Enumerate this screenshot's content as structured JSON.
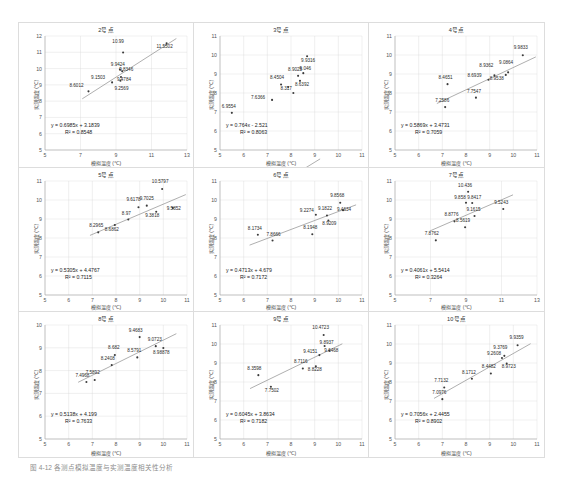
{
  "figure": {
    "caption": "图 4-12  各测点模拟温度与实测温度相关性分析",
    "axis_x_label": "模拟温度 (℃)",
    "axis_y_label": "实测温度 (℃)",
    "marker_color": "#3b3b3b",
    "trend_color": "#8c8c8c",
    "grid_color": "#d9d9d9"
  },
  "chart_data": [
    {
      "type": "scatter",
      "title": "2号点",
      "xlabel": "模拟温度 (℃)",
      "ylabel": "实测温度 (℃)",
      "xlim": [
        5,
        13
      ],
      "ylim": [
        5,
        12
      ],
      "xticks": [
        5,
        7,
        9,
        11,
        13
      ],
      "yticks": [
        5,
        6,
        7,
        8,
        9,
        10,
        11,
        12
      ],
      "grid": true,
      "equation": "y = 0.6985x + 3.1839",
      "r2": "R² = 0.8548",
      "slope": 0.6985,
      "intercept": 3.1839,
      "points": [
        {
          "x": 7.45,
          "y": 8.6012,
          "label": "8.6012",
          "lx": -12,
          "ly": -4
        },
        {
          "x": 8.78,
          "y": 9.1503,
          "label": "9.1503",
          "lx": -14,
          "ly": -3
        },
        {
          "x": 9.35,
          "y": 9.8346,
          "label": "9.8346",
          "lx": 4,
          "ly": 0
        },
        {
          "x": 9.28,
          "y": 9.4784,
          "label": "9.4784",
          "lx": 3,
          "ly": 4
        },
        {
          "x": 9.25,
          "y": 9.2569,
          "label": "9.2569",
          "lx": 1,
          "ly": 9
        },
        {
          "x": 9.22,
          "y": 9.9424,
          "label": "9.9424",
          "lx": -2,
          "ly": -4
        },
        {
          "x": 9.4,
          "y": 10.99,
          "label": "10.99",
          "lx": -5,
          "ly": -9
        },
        {
          "x": 11.85,
          "y": 11.5502,
          "label": "11.5502",
          "lx": -2,
          "ly": 5
        }
      ]
    },
    {
      "type": "scatter",
      "title": "3号点",
      "xlabel": "模拟温度 (℃)",
      "ylabel": "实测温度 (℃)",
      "xlim": [
        5,
        11
      ],
      "ylim": [
        5,
        11
      ],
      "xticks": [
        5,
        6,
        7,
        8,
        9,
        10,
        11
      ],
      "yticks": [
        5,
        6,
        7,
        8,
        9,
        10,
        11
      ],
      "grid": true,
      "equation": "y = 0.764x - 2.521",
      "r2": "R² = 0.8063",
      "slope": 0.764,
      "intercept": -2.521,
      "points": [
        {
          "x": 5.5,
          "y": 6.9554,
          "label": "6.9554",
          "lx": -3,
          "ly": -5
        },
        {
          "x": 7.2,
          "y": 7.6366,
          "label": "7.6366",
          "lx": -14,
          "ly": -1
        },
        {
          "x": 7.58,
          "y": 8.4504,
          "label": "8.4504",
          "lx": -4,
          "ly": -5
        },
        {
          "x": 7.88,
          "y": 8.317,
          "label": "8.317",
          "lx": -2,
          "ly": 3
        },
        {
          "x": 8.1,
          "y": 8.0,
          "label": "",
          "lx": 0,
          "ly": 0
        },
        {
          "x": 8.3,
          "y": 8.9025,
          "label": "8.9025",
          "lx": -3,
          "ly": -5
        },
        {
          "x": 8.38,
          "y": 8.6392,
          "label": "8.6392",
          "lx": 2,
          "ly": 5
        },
        {
          "x": 8.52,
          "y": 9.046,
          "label": "9.046",
          "lx": 2,
          "ly": -3
        },
        {
          "x": 8.68,
          "y": 9.9316,
          "label": "9.9316",
          "lx": 1,
          "ly": 6
        }
      ]
    },
    {
      "type": "scatter",
      "title": "4号点",
      "xlabel": "模拟温度 (℃)",
      "ylabel": "实测温度 (℃)",
      "xlim": [
        5,
        11
      ],
      "ylim": [
        5,
        11
      ],
      "xticks": [
        5,
        6,
        7,
        8,
        9,
        10,
        11
      ],
      "yticks": [
        5,
        6,
        7,
        8,
        9,
        10,
        11
      ],
      "grid": true,
      "equation": "y = 0.5869x + 3.4731",
      "r2": "R² = 0.7059",
      "slope": 0.5869,
      "intercept": 3.4731,
      "points": [
        {
          "x": 7.12,
          "y": 7.2586,
          "label": "7.2586",
          "lx": -3,
          "ly": -5
        },
        {
          "x": 7.22,
          "y": 8.4651,
          "label": "8.4651",
          "lx": -2,
          "ly": -5
        },
        {
          "x": 8.42,
          "y": 7.7547,
          "label": "7.7547",
          "lx": -2,
          "ly": -5
        },
        {
          "x": 8.95,
          "y": 8.6939,
          "label": "8.6939",
          "lx": -14,
          "ly": -3
        },
        {
          "x": 9.2,
          "y": 8.9362,
          "label": "8.9362",
          "lx": -8,
          "ly": -8
        },
        {
          "x": 9.68,
          "y": 8.9538,
          "label": "8.9538",
          "lx": -9,
          "ly": 5
        },
        {
          "x": 9.78,
          "y": 9.0864,
          "label": "9.0864",
          "lx": -2,
          "ly": -8
        },
        {
          "x": 10.4,
          "y": 9.9833,
          "label": "9.9833",
          "lx": -2,
          "ly": -6
        }
      ]
    },
    {
      "type": "scatter",
      "title": "5号点",
      "xlabel": "模拟温度 (℃)",
      "ylabel": "实测温度 (℃)",
      "xlim": [
        5,
        11
      ],
      "ylim": [
        5,
        11
      ],
      "xticks": [
        5,
        6,
        7,
        8,
        9,
        10,
        11
      ],
      "yticks": [
        5,
        6,
        7,
        8,
        9,
        10,
        11
      ],
      "grid": true,
      "equation": "y = 0.5305x + 4.4767",
      "r2": "R² = 0.7115",
      "slope": 0.5305,
      "intercept": 4.4767,
      "points": [
        {
          "x": 7.25,
          "y": 8.2965,
          "label": "8.2965",
          "lx": -2,
          "ly": -5
        },
        {
          "x": 7.95,
          "y": 8.6862,
          "label": "8.6862",
          "lx": -3,
          "ly": 6
        },
        {
          "x": 8.52,
          "y": 8.97,
          "label": "8.97",
          "lx": -2,
          "ly": -5
        },
        {
          "x": 8.95,
          "y": 9.6178,
          "label": "9.6178",
          "lx": -5,
          "ly": -6
        },
        {
          "x": 9.3,
          "y": 9.7025,
          "label": "9.7025",
          "lx": 0,
          "ly": -6
        },
        {
          "x": 9.7,
          "y": 9.3818,
          "label": "9.3818",
          "lx": -4,
          "ly": 5
        },
        {
          "x": 9.95,
          "y": 10.5797,
          "label": "10.5797",
          "lx": -2,
          "ly": -6
        },
        {
          "x": 10.4,
          "y": 9.5852,
          "label": "9.5852",
          "lx": 1,
          "ly": 2
        }
      ]
    },
    {
      "type": "scatter",
      "title": "6号点",
      "xlabel": "模拟温度 (℃)",
      "ylabel": "实测温度 (℃)",
      "xlim": [
        5,
        11
      ],
      "ylim": [
        5,
        11
      ],
      "xticks": [
        5,
        6,
        7,
        8,
        9,
        10,
        11
      ],
      "yticks": [
        5,
        6,
        7,
        8,
        9,
        10,
        11
      ],
      "grid": true,
      "equation": "y = 0.4713x + 4.679",
      "r2": "R² = 0.7172",
      "slope": 0.4713,
      "intercept": 4.679,
      "points": [
        {
          "x": 6.6,
          "y": 8.1734,
          "label": "8.1734",
          "lx": -3,
          "ly": -5
        },
        {
          "x": 7.22,
          "y": 7.8666,
          "label": "7.8666",
          "lx": 1,
          "ly": -5
        },
        {
          "x": 8.9,
          "y": 8.1948,
          "label": "8.1948",
          "lx": -2,
          "ly": -5
        },
        {
          "x": 9.05,
          "y": 9.2274,
          "label": "9.2274",
          "lx": -9,
          "ly": -3
        },
        {
          "x": 9.52,
          "y": 9.1822,
          "label": "9.1822",
          "lx": -2,
          "ly": -6
        },
        {
          "x": 9.58,
          "y": 8.9209,
          "label": "8.9209",
          "lx": 1,
          "ly": 4
        },
        {
          "x": 10.08,
          "y": 9.8568,
          "label": "9.8568",
          "lx": -3,
          "ly": -6
        },
        {
          "x": 10.2,
          "y": 9.4634,
          "label": "9.4634",
          "lx": 1,
          "ly": 1
        }
      ]
    },
    {
      "type": "scatter",
      "title": "7号点",
      "xlabel": "模拟温度 (℃)",
      "ylabel": "实测温度 (℃)",
      "xlim": [
        5,
        13
      ],
      "ylim": [
        5,
        11
      ],
      "xticks": [
        5,
        7,
        9,
        11,
        13
      ],
      "yticks": [
        5,
        6,
        7,
        8,
        9,
        10,
        11
      ],
      "grid": true,
      "equation": "y = 0.4061x + 5.5414",
      "r2": "R² = 0.3264",
      "slope": 0.4061,
      "intercept": 5.5414,
      "points": [
        {
          "x": 7.3,
          "y": 7.8762,
          "label": "7.8762",
          "lx": -4,
          "ly": -5
        },
        {
          "x": 8.35,
          "y": 8.8776,
          "label": "8.8776",
          "lx": -3,
          "ly": -5
        },
        {
          "x": 8.95,
          "y": 8.5619,
          "label": "8.5619",
          "lx": -2,
          "ly": -5
        },
        {
          "x": 9.0,
          "y": 9.858,
          "label": "9.858",
          "lx": -6,
          "ly": -4
        },
        {
          "x": 9.12,
          "y": 10.436,
          "label": "10.436",
          "lx": -3,
          "ly": -5
        },
        {
          "x": 9.35,
          "y": 9.8417,
          "label": "9.8417",
          "lx": 2,
          "ly": -4
        },
        {
          "x": 9.48,
          "y": 9.1615,
          "label": "9.1615",
          "lx": -1,
          "ly": -5
        },
        {
          "x": 11.1,
          "y": 9.5243,
          "label": "9.5243",
          "lx": -2,
          "ly": -5
        }
      ]
    },
    {
      "type": "scatter",
      "title": "8号点",
      "xlabel": "模拟温度 (℃)",
      "ylabel": "实测温度 (℃)",
      "xlim": [
        5,
        11
      ],
      "ylim": [
        5,
        10
      ],
      "xticks": [
        5,
        6,
        7,
        8,
        9,
        10,
        11
      ],
      "yticks": [
        5,
        6,
        7,
        8,
        9,
        10
      ],
      "grid": true,
      "equation": "y = 0.5138x + 4.199",
      "r2": "R² = 0.7633",
      "slope": 0.5138,
      "intercept": 4.199,
      "points": [
        {
          "x": 6.75,
          "y": 7.4968,
          "label": "7.4968",
          "lx": -4,
          "ly": -5
        },
        {
          "x": 7.1,
          "y": 7.5892,
          "label": "7.5892",
          "lx": -2,
          "ly": -6
        },
        {
          "x": 7.82,
          "y": 8.2408,
          "label": "8.2408",
          "lx": -4,
          "ly": -5
        },
        {
          "x": 7.95,
          "y": 8.682,
          "label": "8.682",
          "lx": -1,
          "ly": -6
        },
        {
          "x": 8.9,
          "y": 8.5791,
          "label": "8.5791",
          "lx": -3,
          "ly": -5
        },
        {
          "x": 9.0,
          "y": 9.4683,
          "label": "9.4683",
          "lx": -4,
          "ly": -5
        },
        {
          "x": 9.68,
          "y": 9.0723,
          "label": "9.0723",
          "lx": -1,
          "ly": -5
        },
        {
          "x": 10.0,
          "y": 8.98878,
          "label": "8.98878",
          "lx": -2,
          "ly": 6
        }
      ]
    },
    {
      "type": "scatter",
      "title": "9号点",
      "xlabel": "模拟温度 (℃)",
      "ylabel": "实测温度 (℃)",
      "xlim": [
        5,
        11
      ],
      "ylim": [
        5,
        11
      ],
      "xticks": [
        5,
        6,
        7,
        8,
        9,
        10,
        11
      ],
      "yticks": [
        5,
        6,
        7,
        8,
        9,
        10,
        11
      ],
      "grid": true,
      "equation": "y = 0.6045x + 3.8634",
      "r2": "R² = 0.7182",
      "slope": 0.6045,
      "intercept": 3.8634,
      "points": [
        {
          "x": 6.62,
          "y": 8.3598,
          "label": "8.3598",
          "lx": -4,
          "ly": -5
        },
        {
          "x": 7.15,
          "y": 7.7502,
          "label": "7.7502",
          "lx": 1,
          "ly": 5
        },
        {
          "x": 8.5,
          "y": 8.7116,
          "label": "8.7116",
          "lx": -2,
          "ly": -5
        },
        {
          "x": 9.05,
          "y": 8.8228,
          "label": "8.8228",
          "lx": -1,
          "ly": 5
        },
        {
          "x": 9.2,
          "y": 9.4151,
          "label": "9.4151",
          "lx": -9,
          "ly": -2
        },
        {
          "x": 9.38,
          "y": 10.4723,
          "label": "10.4723",
          "lx": -3,
          "ly": -6
        },
        {
          "x": 9.42,
          "y": 9.8937,
          "label": "9.8937",
          "lx": 2,
          "ly": -2
        },
        {
          "x": 9.62,
          "y": 9.6468,
          "label": "9.6468",
          "lx": 2,
          "ly": 1
        }
      ]
    },
    {
      "type": "scatter",
      "title": "10号点",
      "xlabel": "模拟温度 (℃)",
      "ylabel": "实测温度 (℃)",
      "xlim": [
        5,
        11
      ],
      "ylim": [
        5,
        11
      ],
      "xticks": [
        5,
        6,
        7,
        8,
        9,
        10,
        11
      ],
      "yticks": [
        5,
        6,
        7,
        8,
        9,
        10,
        11
      ],
      "grid": true,
      "equation": "y = 0.7056x + 2.4455",
      "r2": "R² = 0.8902",
      "slope": 0.7056,
      "intercept": 2.4455,
      "points": [
        {
          "x": 7.0,
          "y": 7.0976,
          "label": "7.0976",
          "lx": -3,
          "ly": -5
        },
        {
          "x": 7.08,
          "y": 7.7132,
          "label": "7.7132",
          "lx": -3,
          "ly": -5
        },
        {
          "x": 8.25,
          "y": 8.1712,
          "label": "8.1712",
          "lx": -3,
          "ly": -5
        },
        {
          "x": 9.05,
          "y": 8.4482,
          "label": "8.4482",
          "lx": -2,
          "ly": -5
        },
        {
          "x": 9.52,
          "y": 9.2608,
          "label": "9.2608",
          "lx": -8,
          "ly": -3
        },
        {
          "x": 9.62,
          "y": 9.3769,
          "label": "9.3769",
          "lx": -4,
          "ly": -7
        },
        {
          "x": 9.72,
          "y": 8.9723,
          "label": "8.9723",
          "lx": 2,
          "ly": 4
        },
        {
          "x": 10.18,
          "y": 9.9359,
          "label": "9.9359",
          "lx": -1,
          "ly": -6
        }
      ]
    }
  ]
}
